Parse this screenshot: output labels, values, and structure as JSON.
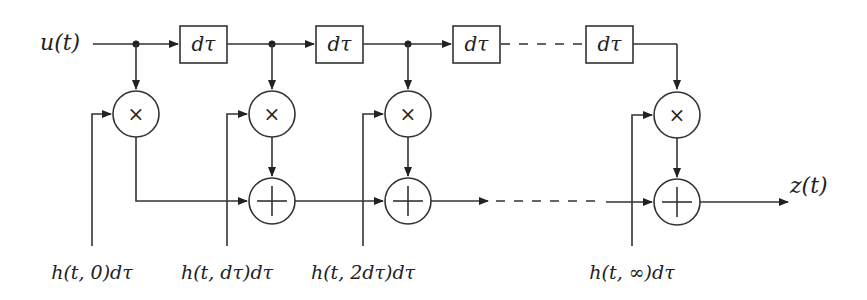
{
  "diagram": {
    "input": {
      "label": "u(t)"
    },
    "output": {
      "label": "z(t)"
    },
    "delay_blocks": [
      {
        "label": "dτ"
      },
      {
        "label": "dτ"
      },
      {
        "label": "dτ"
      },
      {
        "label": "dτ"
      }
    ],
    "multipliers": [
      {
        "symbol": "×"
      },
      {
        "symbol": "×"
      },
      {
        "symbol": "×"
      },
      {
        "symbol": "×"
      }
    ],
    "adders": [
      {
        "symbol": "+"
      },
      {
        "symbol": "+"
      },
      {
        "symbol": "+"
      }
    ],
    "tap_labels": [
      "h(t, 0)dτ",
      "h(t, dτ)dτ",
      "h(t, 2dτ)dτ",
      "h(t, ∞)dτ"
    ],
    "colors": {
      "stroke": "#333333",
      "background": "#ffffff"
    }
  }
}
